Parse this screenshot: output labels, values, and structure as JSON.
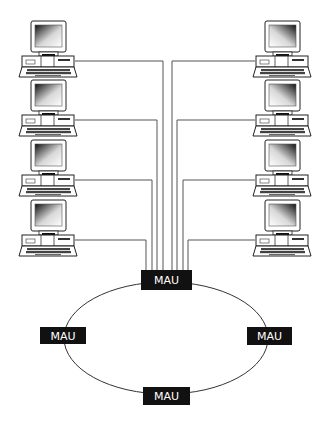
{
  "diagram": {
    "type": "token-ring-network",
    "colors": {
      "background": "#ffffff",
      "line": "#555555",
      "mau_fill": "#111111",
      "mau_text": "#ffffff",
      "computer_outline": "#222222"
    },
    "mau_units": [
      {
        "id": "mau-top",
        "label": "MAU",
        "x": 141,
        "y": 270,
        "w": 51,
        "h": 20
      },
      {
        "id": "mau-left",
        "label": "MAU",
        "x": 40,
        "y": 327,
        "w": 46,
        "h": 17
      },
      {
        "id": "mau-right",
        "label": "MAU",
        "x": 247,
        "y": 327,
        "w": 45,
        "h": 18
      },
      {
        "id": "mau-bottom",
        "label": "MAU",
        "x": 143,
        "y": 387,
        "w": 47,
        "h": 18
      }
    ],
    "ring": {
      "cx": 166,
      "cy": 338,
      "rx": 102,
      "ry": 56
    },
    "computers": [
      {
        "id": "pc-left-1",
        "side": "left",
        "x": 19,
        "y": 21,
        "link_y": 61,
        "trunk_x": 163
      },
      {
        "id": "pc-left-2",
        "side": "left",
        "x": 19,
        "y": 80,
        "link_y": 120,
        "trunk_x": 157
      },
      {
        "id": "pc-left-3",
        "side": "left",
        "x": 19,
        "y": 140,
        "link_y": 180,
        "trunk_x": 152
      },
      {
        "id": "pc-left-4",
        "side": "left",
        "x": 19,
        "y": 200,
        "link_y": 240,
        "trunk_x": 146
      },
      {
        "id": "pc-right-1",
        "side": "right",
        "x": 253,
        "y": 21,
        "link_y": 61,
        "trunk_x": 172
      },
      {
        "id": "pc-right-2",
        "side": "right",
        "x": 253,
        "y": 80,
        "link_y": 120,
        "trunk_x": 177
      },
      {
        "id": "pc-right-3",
        "side": "right",
        "x": 253,
        "y": 140,
        "link_y": 180,
        "trunk_x": 183
      },
      {
        "id": "pc-right-4",
        "side": "right",
        "x": 253,
        "y": 200,
        "link_y": 240,
        "trunk_x": 188
      }
    ]
  }
}
